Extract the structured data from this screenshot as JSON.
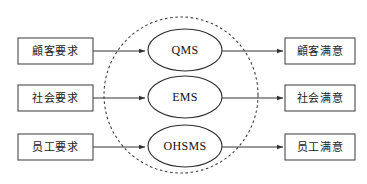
{
  "diagram": {
    "colors": {
      "background": "#ffffff",
      "box_stroke": "#4a4a4a",
      "ellipse_stroke": "#2b2b2b",
      "boundary_stroke": "#3a3a3a",
      "arrow": "#333333",
      "text": "#1a1a1a"
    },
    "inputs": [
      {
        "label": "顧客要求",
        "x": 18,
        "y": 38,
        "w": 75,
        "h": 26
      },
      {
        "label": "社会要求",
        "x": 18,
        "y": 85,
        "w": 75,
        "h": 26
      },
      {
        "label": "员工要求",
        "x": 18,
        "y": 134,
        "w": 75,
        "h": 26
      }
    ],
    "systems": [
      {
        "label": "QMS",
        "cx": 185,
        "cy": 50,
        "rx": 37,
        "ry": 21
      },
      {
        "label": "EMS",
        "cx": 185,
        "cy": 97,
        "rx": 37,
        "ry": 21
      },
      {
        "label": "OHSMS",
        "cx": 185,
        "cy": 146,
        "rx": 37,
        "ry": 21
      }
    ],
    "outputs": [
      {
        "label": "顧客满意",
        "x": 285,
        "y": 38,
        "w": 70,
        "h": 26
      },
      {
        "label": "社会满意",
        "x": 285,
        "y": 85,
        "w": 70,
        "h": 26
      },
      {
        "label": "员工满意",
        "x": 285,
        "y": 134,
        "w": 70,
        "h": 26
      }
    ],
    "boundary": {
      "name": "integrated-management-system-boundary",
      "cx": 181,
      "cy": 95,
      "rx": 77,
      "ry": 78,
      "style": "dashed"
    },
    "arrows": {
      "input_arrows": [
        {
          "x1": 93,
          "y1": 51,
          "x2": 146,
          "y2": 51
        },
        {
          "x1": 93,
          "y1": 98,
          "x2": 146,
          "y2": 98
        },
        {
          "x1": 93,
          "y1": 147,
          "x2": 146,
          "y2": 147
        }
      ],
      "output_arrows": [
        {
          "x1": 222,
          "y1": 51,
          "x2": 283,
          "y2": 51
        },
        {
          "x1": 222,
          "y1": 98,
          "x2": 283,
          "y2": 98
        },
        {
          "x1": 222,
          "y1": 147,
          "x2": 283,
          "y2": 147
        }
      ]
    }
  }
}
